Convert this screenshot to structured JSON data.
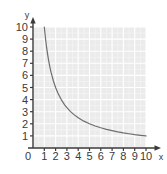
{
  "chart_data": {
    "type": "line",
    "title": "",
    "xlabel": "x",
    "ylabel": "y",
    "xlim": [
      0,
      10
    ],
    "ylim": [
      0,
      10
    ],
    "grid": true,
    "legend": null,
    "origin_label": "0",
    "x_ticks": [
      "1",
      "2",
      "3",
      "4",
      "5",
      "6",
      "7",
      "8",
      "9",
      "10"
    ],
    "y_ticks": [
      "1",
      "2",
      "3",
      "4",
      "5",
      "6",
      "7",
      "8",
      "9",
      "10"
    ],
    "series": [
      {
        "name": "y = 10/x",
        "equation": "y = 10/x",
        "color": "#6e6e6e",
        "x": [
          1.0,
          1.1,
          1.2,
          1.3,
          1.4,
          1.5,
          1.6,
          1.8,
          2.0,
          2.2,
          2.5,
          2.8,
          3.0,
          3.3,
          3.6,
          4.0,
          4.5,
          5.0,
          5.5,
          6.0,
          6.5,
          7.0,
          7.5,
          8.0,
          8.5,
          9.0,
          9.5,
          10.0
        ],
        "values": [
          10.0,
          9.09,
          8.33,
          7.69,
          7.14,
          6.67,
          6.25,
          5.56,
          5.0,
          4.55,
          4.0,
          3.57,
          3.33,
          3.03,
          2.78,
          2.5,
          2.22,
          2.0,
          1.82,
          1.67,
          1.54,
          1.43,
          1.33,
          1.25,
          1.18,
          1.11,
          1.05,
          1.0
        ]
      }
    ]
  },
  "colors": {
    "plot_background": "#ebebeb",
    "grid_line": "#ffffff",
    "grid_line_minor": "#f6f6f6",
    "axis": "#3a3a3a",
    "curve": "#6e6e6e",
    "tick_text": "#3a3a3a"
  }
}
